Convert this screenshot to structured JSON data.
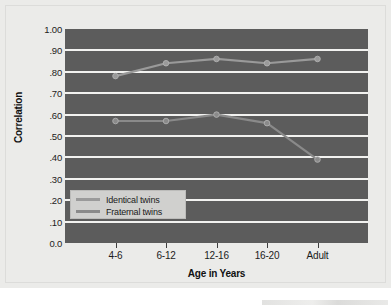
{
  "chart_data": {
    "type": "line",
    "title": "",
    "xlabel": "Age in Years",
    "ylabel": "Correlation",
    "categories": [
      "4-6",
      "6-12",
      "12-16",
      "16-20",
      "Adult"
    ],
    "series": [
      {
        "name": "Identical twins",
        "values": [
          0.78,
          0.84,
          0.86,
          0.84,
          0.86
        ],
        "color": "#9a9a9a"
      },
      {
        "name": "Fraternal twins",
        "values": [
          0.57,
          0.57,
          0.6,
          0.56,
          0.39
        ],
        "color": "#8a8a8a"
      }
    ],
    "ylim": [
      0.0,
      1.0
    ],
    "ytick_values": [
      1.0,
      0.9,
      0.8,
      0.7,
      0.6,
      0.5,
      0.4,
      0.3,
      0.2,
      0.1,
      0.0
    ],
    "ytick_labels": [
      "1.00",
      ".90",
      ".80",
      ".70",
      ".60",
      ".50",
      ".40",
      ".30",
      ".20",
      ".10",
      "0.0"
    ],
    "gridlines": true,
    "grid_color": "#f2f2f0",
    "plot_background": "#5c5c5c",
    "figure_background": "#ebebe9",
    "legend_position": "inside-lower-left",
    "markers": "circle"
  },
  "legend": {
    "items": [
      {
        "label": "Identical twins"
      },
      {
        "label": "Fraternal twins"
      }
    ]
  },
  "axes": {
    "y_title": "Correlation",
    "x_title": "Age in Years"
  }
}
